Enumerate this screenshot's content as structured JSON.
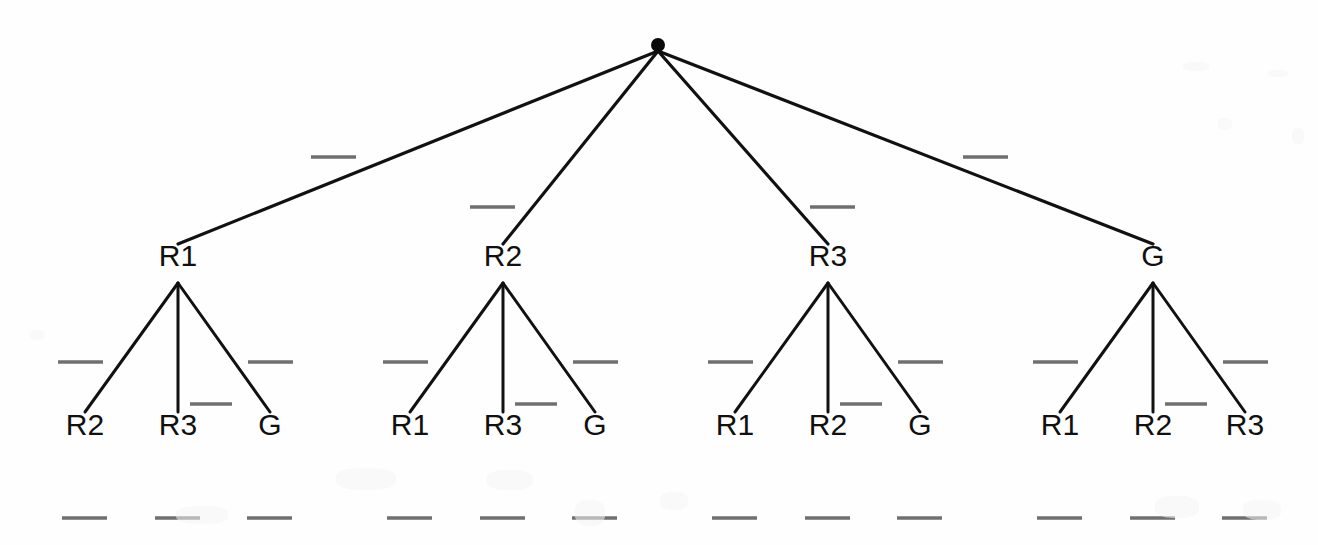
{
  "figure": {
    "type": "game-tree-diagram",
    "background_color": "#fefefe",
    "ink_color": "#111111",
    "redaction_color": "#6f6f6f",
    "width": 1318,
    "height": 545
  },
  "root": {
    "name": "root-node",
    "label": "",
    "x": 658,
    "y": 45,
    "radius": 7
  },
  "level1": {
    "label_y": 271,
    "branch_apex_y": 283,
    "nodes": [
      {
        "label": "R1",
        "x": 178
      },
      {
        "label": "R2",
        "x": 503
      },
      {
        "label": "R3",
        "x": 828
      },
      {
        "label": "G",
        "x": 1153
      }
    ]
  },
  "leaves": {
    "label_y": 440,
    "groups": [
      {
        "parent": "R1",
        "items": [
          {
            "label": "R2",
            "x": 85
          },
          {
            "label": "R3",
            "x": 178
          },
          {
            "label": "G",
            "x": 270
          }
        ]
      },
      {
        "parent": "R2",
        "items": [
          {
            "label": "R1",
            "x": 410
          },
          {
            "label": "R3",
            "x": 503
          },
          {
            "label": "G",
            "x": 595
          }
        ]
      },
      {
        "parent": "R3",
        "items": [
          {
            "label": "R1",
            "x": 735
          },
          {
            "label": "R2",
            "x": 828
          },
          {
            "label": "G",
            "x": 920
          }
        ]
      },
      {
        "parent": "G",
        "items": [
          {
            "label": "R1",
            "x": 1060
          },
          {
            "label": "R2",
            "x": 1153
          },
          {
            "label": "R3",
            "x": 1245
          }
        ]
      }
    ]
  },
  "redacted_labels": {
    "description": "blanked-out payoff and action labels rendered as short gray dashes",
    "top_edges": [
      {
        "x1": 311,
        "x2": 356,
        "y": 157
      },
      {
        "x1": 470,
        "x2": 515,
        "y": 207
      },
      {
        "x1": 810,
        "x2": 855,
        "y": 207
      },
      {
        "x1": 963,
        "x2": 1008,
        "y": 157
      }
    ],
    "branch_sides": [
      {
        "x1": 58,
        "x2": 103,
        "y": 362
      },
      {
        "x1": 248,
        "x2": 293,
        "y": 362
      },
      {
        "x1": 383,
        "x2": 428,
        "y": 362
      },
      {
        "x1": 573,
        "x2": 618,
        "y": 362
      },
      {
        "x1": 708,
        "x2": 753,
        "y": 362
      },
      {
        "x1": 898,
        "x2": 943,
        "y": 362
      },
      {
        "x1": 1033,
        "x2": 1078,
        "y": 362
      },
      {
        "x1": 1223,
        "x2": 1268,
        "y": 362
      }
    ],
    "middle_leaf": [
      {
        "x1": 190,
        "x2": 232,
        "y": 404
      },
      {
        "x1": 515,
        "x2": 557,
        "y": 404
      },
      {
        "x1": 840,
        "x2": 882,
        "y": 404
      },
      {
        "x1": 1165,
        "x2": 1207,
        "y": 404
      }
    ],
    "bottom_row": [
      {
        "x1": 62,
        "x2": 107,
        "y": 518
      },
      {
        "x1": 155,
        "x2": 200,
        "y": 518
      },
      {
        "x1": 247,
        "x2": 292,
        "y": 518
      },
      {
        "x1": 387,
        "x2": 432,
        "y": 518
      },
      {
        "x1": 480,
        "x2": 525,
        "y": 518
      },
      {
        "x1": 572,
        "x2": 617,
        "y": 518
      },
      {
        "x1": 712,
        "x2": 757,
        "y": 518
      },
      {
        "x1": 805,
        "x2": 850,
        "y": 518
      },
      {
        "x1": 897,
        "x2": 942,
        "y": 518
      },
      {
        "x1": 1037,
        "x2": 1082,
        "y": 518
      },
      {
        "x1": 1130,
        "x2": 1175,
        "y": 518
      },
      {
        "x1": 1222,
        "x2": 1267,
        "y": 518
      }
    ]
  }
}
